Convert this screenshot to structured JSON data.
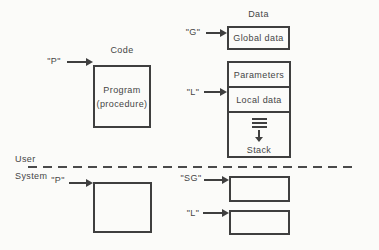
{
  "user_space": {
    "code": {
      "pointer_label": "\"P\"",
      "title": "Code",
      "box_line1": "Program",
      "box_line2": "(procedure)"
    },
    "data": {
      "title": "Data",
      "global_pointer_label": "\"G\"",
      "global_box_label": "Global data",
      "local_pointer_label": "\"L\"",
      "segments": {
        "parameters": "Parameters",
        "local": "Local data",
        "stack": "Stack"
      }
    }
  },
  "boundary": {
    "user_label": "User",
    "system_label": "System"
  },
  "system_space": {
    "code_pointer_label": "\"P\"",
    "sg_pointer_label": "\"SG\"",
    "l_pointer_label": "\"L\""
  },
  "colors": {
    "background": "#fbfbf9",
    "line": "#3f3f3f",
    "text": "#454545"
  }
}
